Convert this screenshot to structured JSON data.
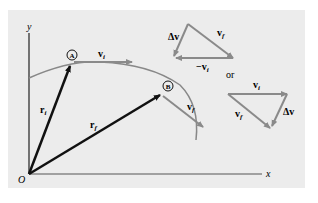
{
  "diagram": {
    "axes": {
      "y_label": "y",
      "x_label": "x",
      "origin_label": "O"
    },
    "points": {
      "A": "A",
      "B": "B"
    },
    "vectors": {
      "vi": "v",
      "vi_sub": "i",
      "vf": "v",
      "vf_sub": "f",
      "ri": "r",
      "ri_sub": "i",
      "rf": "r",
      "rf_sub": "f"
    },
    "triangle1": {
      "dv": "Δv",
      "vf": "v",
      "vf_sub": "f",
      "neg_vi": "−v",
      "neg_vi_sub": "i"
    },
    "or_label": "or",
    "triangle2": {
      "vi": "v",
      "vi_sub": "i",
      "vf": "v",
      "vf_sub": "f",
      "dv": "Δv"
    },
    "colors": {
      "background": "#ececec",
      "curve": "#888888",
      "arrow_gray": "#8a8a8a",
      "arrow_black": "#111111"
    }
  }
}
